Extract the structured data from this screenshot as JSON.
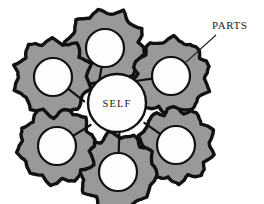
{
  "diagram": {
    "background_color": "#ffffff",
    "canvas": {
      "width": 264,
      "height": 204
    },
    "hub": {
      "label": "SELF",
      "center_x": 117,
      "center_y": 103,
      "radius": 29,
      "fill_color": "#fdfdfd",
      "stroke_color": "#111111"
    },
    "annotation": {
      "label": "PARTS",
      "label_x": 212,
      "label_y": 29,
      "leader_from_x": 216,
      "leader_from_y": 35,
      "leader_to_x": 184,
      "leader_to_y": 64,
      "stroke_color": "#222222"
    },
    "gear_style": {
      "fill_color": "#999999",
      "outline_color": "#111111",
      "hole_fill_color": "#fdfdfd",
      "teeth_count": 10
    },
    "gears": [
      {
        "name": "gear-top",
        "position_label": "top",
        "center_x": 105,
        "center_y": 48,
        "outer_radius": 41,
        "hole_radius": 19,
        "rotation_deg": 8,
        "slot_angle_deg": 100
      },
      {
        "name": "gear-upper-right",
        "position_label": "upper-right",
        "center_x": 171,
        "center_y": 76,
        "outer_radius": 40,
        "hole_radius": 19,
        "rotation_deg": 22,
        "slot_angle_deg": 172
      },
      {
        "name": "gear-lower-right",
        "position_label": "lower-right",
        "center_x": 176,
        "center_y": 145,
        "outer_radius": 39,
        "hole_radius": 19,
        "rotation_deg": 14,
        "slot_angle_deg": 215
      },
      {
        "name": "gear-bottom",
        "position_label": "bottom",
        "center_x": 118,
        "center_y": 172,
        "outer_radius": 40,
        "hole_radius": 19,
        "rotation_deg": 5,
        "slot_angle_deg": 272
      },
      {
        "name": "gear-lower-left",
        "position_label": "lower-left",
        "center_x": 57,
        "center_y": 146,
        "outer_radius": 40,
        "hole_radius": 19,
        "rotation_deg": 27,
        "slot_angle_deg": 328
      },
      {
        "name": "gear-upper-left",
        "position_label": "upper-left",
        "center_x": 53,
        "center_y": 77,
        "outer_radius": 40,
        "hole_radius": 19,
        "rotation_deg": 17,
        "slot_angle_deg": 38
      }
    ]
  }
}
